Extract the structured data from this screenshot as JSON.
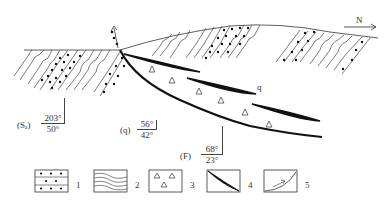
{
  "diagram": {
    "north_label": "N",
    "vein_label": "q",
    "attitudes": [
      {
        "id": "Sa",
        "label": "(Sₐ)",
        "strike": "203°",
        "dip": "50°"
      },
      {
        "id": "q",
        "label": "(q)",
        "strike": "56°",
        "dip": "42°"
      },
      {
        "id": "F",
        "label": "(F)",
        "strike": "68°",
        "dip": "23°"
      }
    ]
  },
  "legend": {
    "items": [
      {
        "number": "1",
        "symbol": "dotted-sandstone"
      },
      {
        "number": "2",
        "symbol": "folded-strata"
      },
      {
        "number": "3",
        "symbol": "breccia-triangles"
      },
      {
        "number": "4",
        "symbol": "quartz-vein-lens"
      },
      {
        "number": "5",
        "symbol": "thrust-fault"
      }
    ]
  }
}
